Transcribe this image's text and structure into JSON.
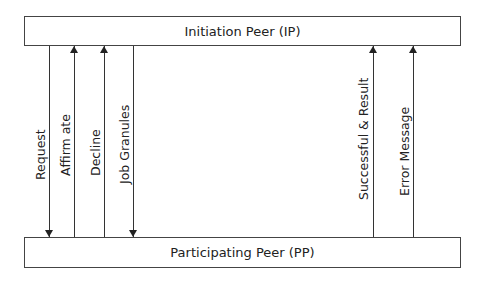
{
  "diagram": {
    "top_box": {
      "label": "Initiation Peer (IP)"
    },
    "bottom_box": {
      "label": "Participating Peer (PP)"
    },
    "messages": [
      {
        "label": "Request",
        "direction": "down",
        "x": 49,
        "label_bottom": 180
      },
      {
        "label": "Affirm ate",
        "direction": "up",
        "x": 74,
        "label_bottom": 176
      },
      {
        "label": "Decline",
        "direction": "up",
        "x": 104,
        "label_bottom": 176
      },
      {
        "label": "Job Granules",
        "direction": "down",
        "x": 133,
        "label_bottom": 184
      },
      {
        "label": "Successful & Result",
        "direction": "up",
        "x": 373,
        "label_bottom": 200
      },
      {
        "label": "Error Message",
        "direction": "up",
        "x": 413,
        "label_bottom": 196
      }
    ]
  }
}
